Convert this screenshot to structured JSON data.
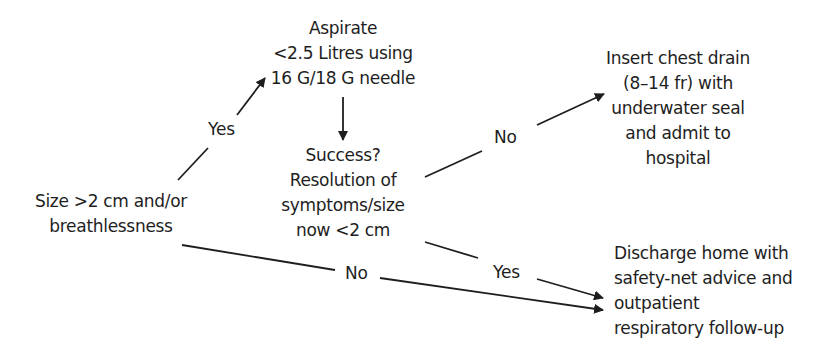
{
  "diagram": {
    "type": "flowchart",
    "colors": {
      "background": "#ffffff",
      "text": "#1e1e1e",
      "line": "#1e1e1e"
    },
    "nodes": {
      "start": {
        "lines": [
          "Size >2 cm and/or",
          "breathlessness"
        ]
      },
      "aspirate": {
        "lines": [
          "Aspirate",
          "<2.5 Litres using",
          "16 G/18 G needle"
        ]
      },
      "success": {
        "lines": [
          "Success?",
          "Resolution of",
          "symptoms/size",
          "now <2 cm"
        ]
      },
      "chest_drain": {
        "lines": [
          "Insert chest drain",
          "(8–14 fr) with",
          "underwater seal",
          "and admit to",
          "hospital"
        ]
      },
      "discharge": {
        "lines": [
          "Discharge home with",
          "safety-net advice and",
          "outpatient",
          "respiratory follow-up"
        ]
      }
    },
    "edges": [
      {
        "from": "start",
        "to": "aspirate",
        "label": "Yes"
      },
      {
        "from": "aspirate",
        "to": "success",
        "label": ""
      },
      {
        "from": "success",
        "to": "chest_drain",
        "label": "No"
      },
      {
        "from": "success",
        "to": "discharge",
        "label": "Yes"
      },
      {
        "from": "start",
        "to": "discharge",
        "label": "No"
      }
    ],
    "edge_labels": {
      "start_to_aspirate": "Yes",
      "success_to_chest_drain": "No",
      "success_to_discharge": "Yes",
      "start_to_discharge": "No"
    }
  }
}
